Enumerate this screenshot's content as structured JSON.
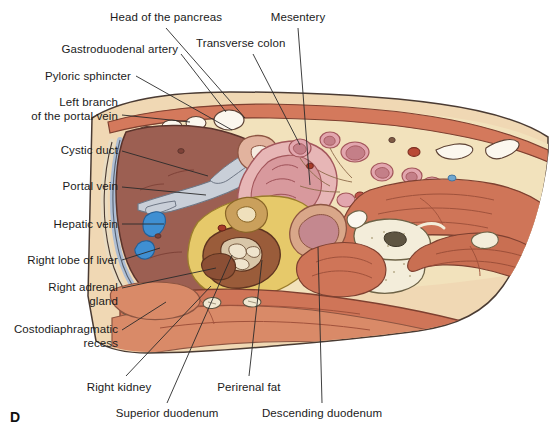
{
  "figure": {
    "panel_letter": "D",
    "type": "anatomical-cross-section"
  },
  "labels": [
    {
      "id": "head-of-the-pancreas",
      "text": "Head of the pancreas",
      "align": "center",
      "x": 166,
      "y": 11,
      "leader": [
        [
          166,
          28
        ],
        [
          245,
          118
        ]
      ]
    },
    {
      "id": "mesentery",
      "text": "Mesentery",
      "align": "center",
      "x": 298,
      "y": 11,
      "leader": [
        [
          298,
          28
        ],
        [
          310,
          185
        ]
      ]
    },
    {
      "id": "transverse-colon",
      "text": "Transverse colon",
      "align": "left",
      "x": 196,
      "y": 37,
      "leader": [
        [
          253,
          54
        ],
        [
          300,
          145
        ]
      ]
    },
    {
      "id": "gastroduodenal-artery",
      "text": "Gastroduodenal artery",
      "align": "right",
      "x": 178,
      "y": 43,
      "leader": [
        [
          181,
          54
        ],
        [
          226,
          112
        ]
      ]
    },
    {
      "id": "pyloric-sphincter",
      "text": "Pyloric sphincter",
      "align": "right",
      "x": 131,
      "y": 70,
      "leader": [
        [
          136,
          76
        ],
        [
          232,
          130
        ]
      ]
    },
    {
      "id": "left-branch-portal-vein",
      "text": "Left branch\nof the portal vein",
      "align": "right",
      "x": 118,
      "y": 96,
      "leader": [
        [
          122,
          115
        ],
        [
          190,
          122
        ]
      ]
    },
    {
      "id": "cystic-duct",
      "text": "Cystic duct",
      "align": "right",
      "x": 118,
      "y": 144,
      "leader": [
        [
          122,
          151
        ],
        [
          208,
          176
        ]
      ]
    },
    {
      "id": "portal-vein",
      "text": "Portal vein",
      "align": "right",
      "x": 118,
      "y": 180,
      "leader": [
        [
          122,
          187
        ],
        [
          206,
          195
        ]
      ]
    },
    {
      "id": "hepatic-vein",
      "text": "Hepatic vein",
      "align": "right",
      "x": 118,
      "y": 218,
      "leader": [
        [
          122,
          224
        ],
        [
          164,
          224
        ]
      ]
    },
    {
      "id": "right-lobe-of-liver",
      "text": "Right lobe of liver",
      "align": "right",
      "x": 118,
      "y": 254,
      "leader": [
        [
          122,
          260
        ],
        [
          160,
          248
        ]
      ]
    },
    {
      "id": "right-adrenal-gland",
      "text": "Right adrenal\ngland",
      "align": "right",
      "x": 118,
      "y": 281,
      "leader": [
        [
          122,
          288
        ],
        [
          216,
          268
        ]
      ]
    },
    {
      "id": "costodiaphragmatic-recess",
      "text": "Costodiaphragmatic\nrecess",
      "align": "right",
      "x": 118,
      "y": 323,
      "leader": [
        [
          122,
          330
        ],
        [
          166,
          302
        ]
      ]
    },
    {
      "id": "right-kidney",
      "text": "Right kidney",
      "align": "center",
      "x": 119,
      "y": 381,
      "leader": [
        [
          126,
          376
        ],
        [
          211,
          286
        ]
      ]
    },
    {
      "id": "superior-duodenum",
      "text": "Superior duodenum",
      "align": "center",
      "x": 167,
      "y": 407,
      "leader": [
        [
          167,
          403
        ],
        [
          232,
          255
        ]
      ]
    },
    {
      "id": "perirenal-fat",
      "text": "Perirenal fat",
      "align": "center",
      "x": 249,
      "y": 381,
      "leader": [
        [
          249,
          376
        ],
        [
          262,
          260
        ]
      ]
    },
    {
      "id": "descending-duodenum",
      "text": "Descending duodenum",
      "align": "center",
      "x": 322,
      "y": 407,
      "leader": [
        [
          322,
          403
        ],
        [
          318,
          247
        ]
      ]
    }
  ],
  "palette": {
    "skin_outline": "#4a3b33",
    "subcutaneous_fat": "#f0d8b4",
    "deep_fat": "#f5e3c8",
    "muscle": "#d4795c",
    "muscle_dark": "#c06a4f",
    "liver": "#9c5f52",
    "liver_edge": "#7e4c42",
    "peritoneum_blue": "#aebed4",
    "vein_blue": "#3f8fd2",
    "kidney_brown": "#9a5c3a",
    "perirenal_fat_yellow": "#e6c96a",
    "bowel_pink": "#e0a8a8",
    "bowel_pink_dark": "#c97f85",
    "mesentery_cream": "#f2e2bc",
    "bone_ivory": "#f3edda",
    "pancreas_yellow": "#e8cc6e",
    "artery_red": "#c0392b",
    "white_lumen": "#fbf7ee",
    "line": "#2a2a2a"
  }
}
